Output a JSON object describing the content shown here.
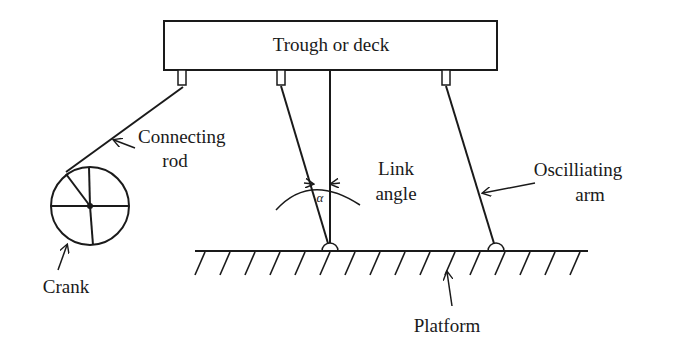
{
  "diagram": {
    "labels": {
      "trough": "Trough or deck",
      "connecting_rod_line1": "Connecting",
      "connecting_rod_line2": "rod",
      "link_angle_line1": "Link",
      "link_angle_line2": "angle",
      "alpha": "α",
      "oscillating_arm_line1": "Oscilliating",
      "oscillating_arm_line2": "arm",
      "crank": "Crank",
      "platform": "Platform"
    },
    "colors": {
      "stroke": "#1a1a1a",
      "background": "#ffffff"
    },
    "components": [
      {
        "name": "trough",
        "type": "rectangle"
      },
      {
        "name": "crank",
        "type": "circle-wheel",
        "spokes": 5
      },
      {
        "name": "connecting-rod",
        "type": "link"
      },
      {
        "name": "left-oscillating-arm",
        "type": "link"
      },
      {
        "name": "right-oscillating-arm",
        "type": "link"
      },
      {
        "name": "vertical-reference",
        "type": "line"
      },
      {
        "name": "platform",
        "type": "hatched-ground"
      }
    ]
  }
}
